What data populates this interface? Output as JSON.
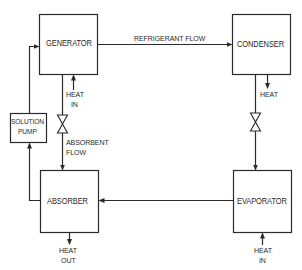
{
  "diagram": {
    "type": "absorption refrigeration cycle",
    "colors": {
      "line": "#2a2a2a",
      "background": "#ffffff"
    },
    "components": {
      "generator": {
        "label": "GENERATOR"
      },
      "condenser": {
        "label": "CONDENSER"
      },
      "absorber": {
        "label": "ABSORBER"
      },
      "evaporator": {
        "label": "EVAPORATOR"
      },
      "solution_pump": {
        "line1": "SOLUTION",
        "line2": "PUMP"
      }
    },
    "flows": {
      "refrigerant": "REFRIGERANT FLOW",
      "absorbent_line1": "ABSORBENT",
      "absorbent_line2": "FLOW"
    },
    "heat_labels": {
      "generator_in_line1": "HEAT",
      "generator_in_line2": "IN",
      "condenser_out": "HEAT",
      "absorber_out_line1": "HEAT",
      "absorber_out_line2": "OUT",
      "evaporator_in_line1": "HEAT",
      "evaporator_in_line2": "IN"
    }
  }
}
